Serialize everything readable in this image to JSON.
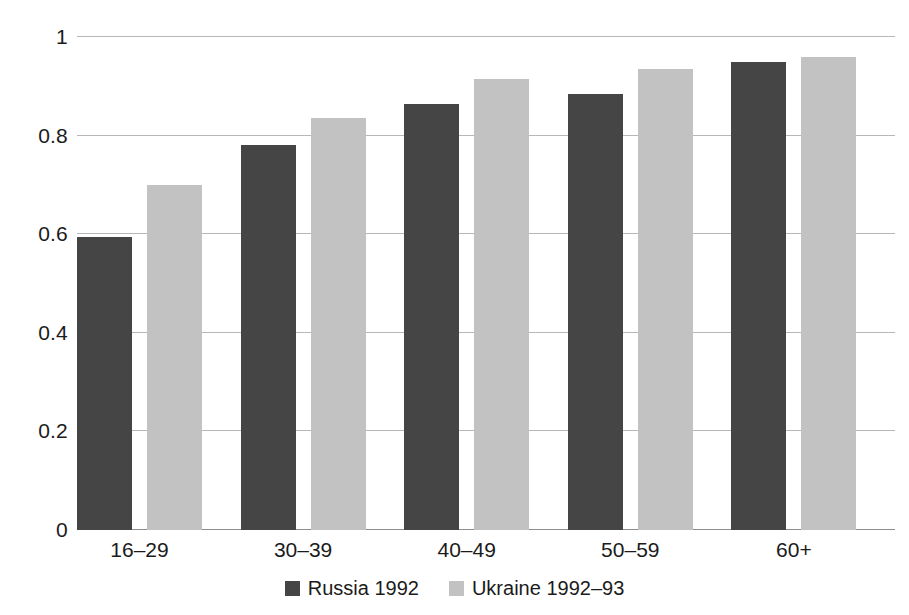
{
  "chart_data": {
    "type": "bar",
    "title": "",
    "subtitle": "",
    "xlabel": "",
    "ylabel": "",
    "categories": [
      "16–29",
      "30–39",
      "40–49",
      "50–59",
      "60+"
    ],
    "series": [
      {
        "name": "Russia 1992",
        "color": "#454545",
        "values": [
          0.595,
          0.78,
          0.865,
          0.885,
          0.95
        ]
      },
      {
        "name": "Ukraine 1992–93",
        "color": "#c2c2c2",
        "values": [
          0.7,
          0.835,
          0.915,
          0.935,
          0.96
        ]
      }
    ],
    "ylim": [
      0,
      1
    ],
    "yticks": [
      0,
      0.2,
      0.4,
      0.6,
      0.8,
      1
    ],
    "ytick_labels": [
      "0",
      "0.2",
      "0.4",
      "0.6",
      "0.8",
      "1"
    ],
    "grid": true,
    "grid_axis": "y",
    "legend_position": "bottom-center",
    "background_color": "#ffffff",
    "gridline_color": "#b7b7b7",
    "axis_color": "#8e8e8e",
    "text_color": "#1b1b1b"
  }
}
